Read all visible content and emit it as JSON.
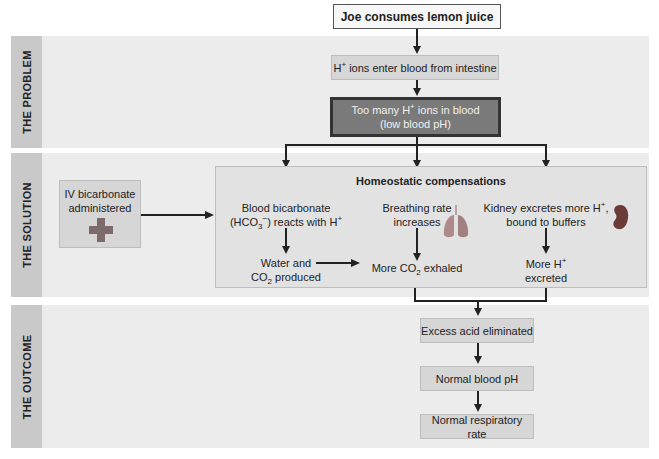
{
  "diagram": {
    "bands": [
      {
        "label": "THE PROBLEM"
      },
      {
        "label": "THE SOLUTION"
      },
      {
        "label": "THE OUTCOME"
      }
    ],
    "start": {
      "text": "Joe consumes lemon juice"
    },
    "problem": {
      "step1": {
        "pre": "H",
        "sup": "+",
        "post": " ions enter blood from intestine"
      },
      "step2": {
        "line1_pre": "Too many H",
        "line1_sup": "+",
        "line1_post": " ions in blood",
        "line2": "(low blood pH)"
      }
    },
    "solution": {
      "iv": {
        "line1": "IV bicarbonate",
        "line2": "administered",
        "icon": "medical-cross-icon"
      },
      "panel_title": "Homeostatic compensations",
      "bicarbonate": {
        "line1": "Blood bicarbonate",
        "line2_pre": "(HCO",
        "line2_sub": "3",
        "line2_sup": "−",
        "line2_post": ") reacts with H",
        "line2_sup2": "+"
      },
      "water": {
        "line1": "Water and",
        "line2_pre": "CO",
        "line2_sub": "2",
        "line2_post": " produced"
      },
      "breathing": {
        "line1": "Breathing rate",
        "line2": "increases",
        "icon": "lungs-icon"
      },
      "co2": {
        "pre": "More CO",
        "sub": "2",
        "post": " exhaled"
      },
      "kidney": {
        "line1_pre": "Kidney excretes more H",
        "line1_sup": "+",
        "line1_post": ",",
        "line2": "bound to buffers",
        "icon": "kidney-icon"
      },
      "more_h": {
        "line1_pre": "More H",
        "line1_sup": "+",
        "line2": "excreted"
      }
    },
    "outcome": {
      "step1": "Excess acid eliminated",
      "step2": "Normal blood pH",
      "step3": "Normal respiratory rate"
    },
    "colors": {
      "band_bg": "#ececec",
      "band_label_bg": "#c9c9c9",
      "box_light": "#d6d6d6",
      "box_dark": "#7a7a7a",
      "cross": "#7d6a6a",
      "lungs": "#b08a8a",
      "kidney": "#6b3b38"
    }
  }
}
